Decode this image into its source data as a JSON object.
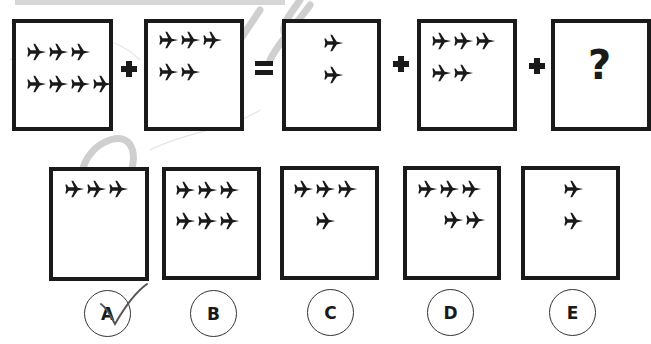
{
  "puzzle": {
    "equation": {
      "terms": [
        {
          "id": "term-1",
          "rows": [
            3,
            3
          ],
          "align": "left"
        },
        {
          "id": "term-2",
          "rows": [
            3,
            2
          ],
          "align": "left"
        },
        {
          "id": "term-3",
          "rows": [
            1,
            1
          ],
          "align": "center"
        },
        {
          "id": "term-4",
          "rows": [
            3,
            2
          ],
          "align": "left"
        },
        {
          "id": "term-5",
          "unknown": true,
          "label": "?"
        }
      ],
      "operators": [
        "+",
        "=",
        "+",
        "+"
      ],
      "unknown_label": "?"
    },
    "options": [
      {
        "label": "A",
        "rows": [
          3
        ],
        "checked": true
      },
      {
        "label": "B",
        "rows": [
          3,
          3
        ],
        "checked": false
      },
      {
        "label": "C",
        "rows": [
          3,
          1
        ],
        "checked": false
      },
      {
        "label": "D",
        "rows": [
          3,
          2
        ],
        "checked": false
      },
      {
        "label": "E",
        "rows": [
          1,
          1
        ],
        "checked": false
      }
    ],
    "icon": "airplane-icon",
    "colors": {
      "ink": "#1a1a1a",
      "banner": "#d6d6d6",
      "watermark": "#c8c8c8",
      "check": "#555555"
    }
  }
}
